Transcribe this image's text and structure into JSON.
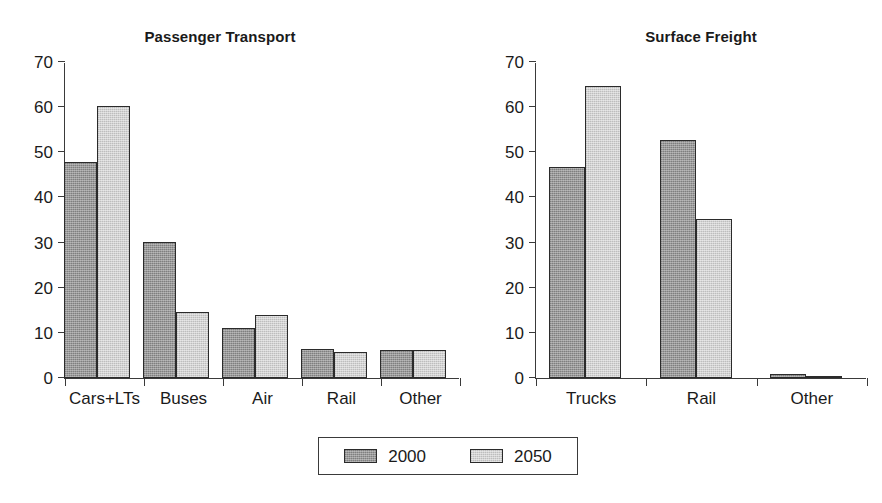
{
  "figure": {
    "width": 882,
    "height": 503,
    "background": "#ffffff"
  },
  "legend": {
    "position": "bottom-center",
    "items": [
      {
        "label": "2000",
        "color": "#8d8d8d",
        "swatch_name": "legend-swatch-2000"
      },
      {
        "label": "2050",
        "color": "#cbcbcb",
        "swatch_name": "legend-swatch-2050"
      }
    ]
  },
  "chart_data": [
    {
      "type": "bar",
      "title": "Passenger Transport",
      "xlabel": "",
      "ylabel": "",
      "ylim": [
        0,
        70
      ],
      "yticks": [
        0,
        10,
        20,
        30,
        40,
        50,
        60,
        70
      ],
      "grid": false,
      "legend_position": "bottom-center",
      "categories": [
        "Cars+LTs",
        "Buses",
        "Air",
        "Rail",
        "Other"
      ],
      "series": [
        {
          "name": "2000",
          "color": "#8d8d8d",
          "values": [
            47.8,
            30.1,
            11.0,
            6.5,
            6.3
          ]
        },
        {
          "name": "2050",
          "color": "#cbcbcb",
          "values": [
            60.2,
            14.7,
            14.0,
            5.7,
            6.3
          ]
        }
      ]
    },
    {
      "type": "bar",
      "title": "Surface Freight",
      "xlabel": "",
      "ylabel": "",
      "ylim": [
        0,
        70
      ],
      "yticks": [
        0,
        10,
        20,
        30,
        40,
        50,
        60,
        70
      ],
      "grid": false,
      "legend_position": "bottom-center",
      "categories": [
        "Trucks",
        "Rail",
        "Other"
      ],
      "series": [
        {
          "name": "2000",
          "color": "#8d8d8d",
          "values": [
            46.8,
            52.7,
            0.8
          ]
        },
        {
          "name": "2050",
          "color": "#cbcbcb",
          "values": [
            64.6,
            35.2,
            0.5
          ]
        }
      ]
    }
  ]
}
